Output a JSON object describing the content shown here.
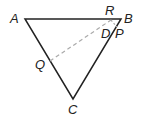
{
  "diagram": {
    "type": "geometry-triangle",
    "points": {
      "A": {
        "label": "A",
        "x": 25,
        "y": 19
      },
      "B": {
        "label": "B",
        "x": 121,
        "y": 19
      },
      "C": {
        "label": "C",
        "x": 73,
        "y": 99
      },
      "Q": {
        "label": "Q",
        "x": 50,
        "y": 61
      },
      "R": {
        "label": "R",
        "x": 111,
        "y": 19
      },
      "P": {
        "label": "P",
        "x": 116,
        "y": 27
      },
      "D": {
        "label": "D"
      }
    },
    "segments": {
      "solid": [
        "AB",
        "BC",
        "CA"
      ],
      "dashed": [
        "QR",
        "RP"
      ]
    },
    "colors": {
      "line": "#222222",
      "dashed": "#aaaaaa"
    }
  }
}
